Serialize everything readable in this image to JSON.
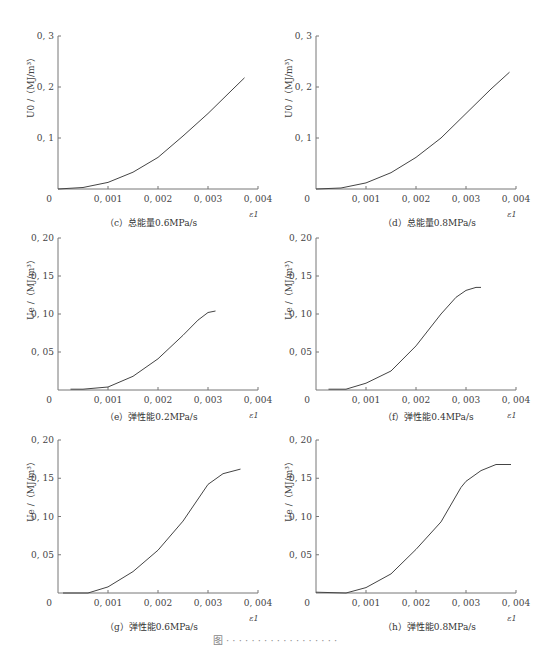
{
  "figure": {
    "caption": "图  ·  ·  ·  ·  ·  ·  ·  ·  ·  ·  ·  ·  ·  ·  ·  ·  ·  ·"
  },
  "colors": {
    "line": "#444444",
    "axis": "#777777",
    "text": "#333333"
  },
  "panels": [
    {
      "id": "c",
      "caption": "（c）总能量0.6MPa/s",
      "ylabel": "U0 /（MJ/m³）",
      "xlabel": "ε1",
      "yticks": [
        "0.1",
        "0.2",
        "0.3"
      ],
      "xticks": [
        "0",
        "0.001",
        "0.002",
        "0.003",
        "0.004"
      ]
    },
    {
      "id": "d",
      "caption": "（d）总能量0.8MPa/s",
      "ylabel": "U0 /（MJ/m³）",
      "xlabel": "ε1",
      "yticks": [
        "0.1",
        "0.2",
        "0.3"
      ],
      "xticks": [
        "0",
        "0.001",
        "0.002",
        "0.003",
        "0.004"
      ]
    },
    {
      "id": "e",
      "caption": "（e）弹性能0.2MPa/s",
      "ylabel": "Ue /（MJ/m³）",
      "xlabel": "ε1",
      "yticks": [
        "0.05",
        "0.10",
        "0.15",
        "0.20"
      ],
      "xticks": [
        "0",
        "0.001",
        "0.002",
        "0.003",
        "0.004"
      ]
    },
    {
      "id": "f",
      "caption": "（f）弹性能0.4MPa/s",
      "ylabel": "Ue /（MJ/m³）",
      "xlabel": "ε1",
      "yticks": [
        "0.05",
        "0.10",
        "0.15",
        "0.20"
      ],
      "xticks": [
        "0",
        "0.001",
        "0.002",
        "0.003",
        "0.004"
      ]
    },
    {
      "id": "g",
      "caption": "（g）弹性能0.6MPa/s",
      "ylabel": "Ue /（MJ/m³）",
      "xlabel": "ε1",
      "yticks": [
        "0.05",
        "0.10",
        "0.15",
        "0.20"
      ],
      "xticks": [
        "0",
        "0.001",
        "0.002",
        "0.003",
        "0.004"
      ]
    },
    {
      "id": "h",
      "caption": "（h）弹性能0.8MPa/s",
      "ylabel": "Ue /（MJ/m³）",
      "xlabel": "ε1",
      "yticks": [
        "0.05",
        "0.10",
        "0.15",
        "0.20"
      ],
      "xticks": [
        "0",
        "0.001",
        "0.002",
        "0.003",
        "0.004"
      ]
    }
  ],
  "chart_data": [
    {
      "type": "line",
      "title": "（c）总能量0.6MPa/s",
      "xlabel": "ε1",
      "ylabel": "U0 /（MJ/m³）",
      "xlim": [
        0,
        0.004
      ],
      "ylim": [
        0,
        0.3
      ],
      "grid": false,
      "x": [
        0,
        0.0005,
        0.001,
        0.0015,
        0.002,
        0.0025,
        0.003,
        0.0035,
        0.00373
      ],
      "values": [
        0,
        0.003,
        0.013,
        0.033,
        0.062,
        0.104,
        0.148,
        0.196,
        0.218
      ]
    },
    {
      "type": "line",
      "title": "（d）总能量0.8MPa/s",
      "xlabel": "ε1",
      "ylabel": "U0 /（MJ/m³）",
      "xlim": [
        0,
        0.004
      ],
      "ylim": [
        0,
        0.3
      ],
      "grid": false,
      "x": [
        0,
        0.0005,
        0.001,
        0.0015,
        0.002,
        0.0025,
        0.003,
        0.0035,
        0.00387
      ],
      "values": [
        0,
        0.002,
        0.012,
        0.032,
        0.062,
        0.1,
        0.148,
        0.196,
        0.229
      ]
    },
    {
      "type": "line",
      "title": "（e）弹性能0.2MPa/s",
      "xlabel": "ε1",
      "ylabel": "Ue /（MJ/m³）",
      "xlim": [
        0,
        0.004
      ],
      "ylim": [
        0,
        0.2
      ],
      "grid": false,
      "x": [
        0.00025,
        0.0005,
        0.001,
        0.0015,
        0.002,
        0.0025,
        0.0028,
        0.003,
        0.00315
      ],
      "values": [
        0.001,
        0.001,
        0.004,
        0.018,
        0.041,
        0.072,
        0.092,
        0.102,
        0.104
      ]
    },
    {
      "type": "line",
      "title": "（f）弹性能0.4MPa/s",
      "xlabel": "ε1",
      "ylabel": "Ue /（MJ/m³）",
      "xlim": [
        0,
        0.004
      ],
      "ylim": [
        0,
        0.2
      ],
      "grid": false,
      "x": [
        0.00025,
        0.0006,
        0.001,
        0.0015,
        0.002,
        0.0025,
        0.0028,
        0.003,
        0.0032,
        0.0033
      ],
      "values": [
        0.001,
        0.001,
        0.009,
        0.025,
        0.058,
        0.1,
        0.122,
        0.131,
        0.135,
        0.135
      ]
    },
    {
      "type": "line",
      "title": "（g）弹性能0.6MPa/s",
      "xlabel": "ε1",
      "ylabel": "Ue /（MJ/m³）",
      "xlim": [
        0,
        0.004
      ],
      "ylim": [
        0,
        0.2
      ],
      "grid": false,
      "x": [
        0.0001,
        0.0006,
        0.001,
        0.0015,
        0.002,
        0.0025,
        0.003,
        0.0033,
        0.00365
      ],
      "values": [
        0,
        0,
        0.008,
        0.028,
        0.056,
        0.094,
        0.142,
        0.156,
        0.162
      ]
    },
    {
      "type": "line",
      "title": "（h）弹性能0.8MPa/s",
      "xlabel": "ε1",
      "ylabel": "Ue /（MJ/m³）",
      "xlim": [
        0,
        0.004
      ],
      "ylim": [
        0,
        0.2
      ],
      "grid": false,
      "x": [
        0,
        0.0006,
        0.001,
        0.0015,
        0.002,
        0.0025,
        0.0029,
        0.003,
        0.0033,
        0.0036,
        0.0039
      ],
      "values": [
        0.001,
        0,
        0.007,
        0.025,
        0.057,
        0.093,
        0.138,
        0.146,
        0.16,
        0.168,
        0.168
      ]
    }
  ]
}
